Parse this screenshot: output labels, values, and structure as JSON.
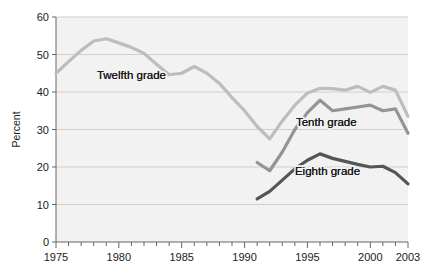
{
  "chart_data": {
    "type": "line",
    "title": "",
    "xlabel": "",
    "ylabel": "Percent",
    "xlim": [
      1975,
      2003
    ],
    "ylim": [
      0,
      60
    ],
    "ytick_labels": [
      "0",
      "10",
      "20",
      "30",
      "40",
      "50",
      "60"
    ],
    "yticks": [
      0,
      10,
      20,
      30,
      40,
      50,
      60
    ],
    "xtick_labels": [
      "1975",
      "1980",
      "1985",
      "1990",
      "1995",
      "2000",
      "2003"
    ],
    "xticks_major": [
      1975,
      1980,
      1985,
      1990,
      1995,
      2000,
      2003
    ],
    "xticks_minor_every": 1,
    "grid": "horizontal",
    "legend": "inline-annotations",
    "plot_bg": "#f2f2f2",
    "grid_color": "#c9c9c9",
    "series": [
      {
        "name": "Twelfth grade",
        "color": "#bdbdbd",
        "label_x": 1981.0,
        "label_y": 43.5,
        "x": [
          1975,
          1976,
          1977,
          1978,
          1979,
          1980,
          1981,
          1982,
          1983,
          1984,
          1985,
          1986,
          1987,
          1988,
          1989,
          1990,
          1991,
          1992,
          1993,
          1994,
          1995,
          1996,
          1997,
          1998,
          1999,
          2000,
          2001,
          2002,
          2003
        ],
        "values": [
          45.0,
          48.1,
          51.1,
          53.6,
          54.2,
          53.1,
          51.9,
          50.3,
          47.4,
          44.6,
          45.0,
          46.8,
          45.0,
          42.3,
          38.5,
          35.0,
          30.8,
          27.5,
          32.3,
          36.5,
          39.7,
          41.0,
          40.9,
          40.5,
          41.5,
          39.9,
          41.5,
          40.5,
          33.5
        ]
      },
      {
        "name": "Tenth grade",
        "color": "#949494",
        "label_x": 1996.5,
        "label_y": 31.0,
        "x": [
          1991,
          1992,
          1993,
          1994,
          1995,
          1996,
          1997,
          1998,
          1999,
          2000,
          2001,
          2002,
          2003
        ],
        "values": [
          21.2,
          19.0,
          24.0,
          30.0,
          34.5,
          37.8,
          35.0,
          35.5,
          36.0,
          36.5,
          35.0,
          35.5,
          29.0
        ]
      },
      {
        "name": "Eighth grade",
        "color": "#555555",
        "label_x": 1996.6,
        "label_y": 18.0,
        "x": [
          1991,
          1992,
          1993,
          1994,
          1995,
          1996,
          1997,
          1998,
          1999,
          2000,
          2001,
          2002,
          2003
        ],
        "values": [
          11.5,
          13.5,
          16.5,
          19.5,
          21.8,
          23.5,
          22.3,
          21.5,
          20.7,
          20.0,
          20.2,
          18.5,
          15.5
        ]
      }
    ]
  },
  "axis": {
    "y_title": "Percent"
  }
}
